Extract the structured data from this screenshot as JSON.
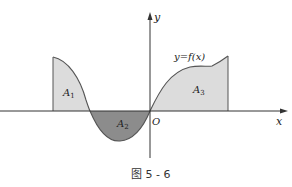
{
  "figure": {
    "caption": "图 5 - 6",
    "axes": {
      "x_label": "x",
      "y_label": "y",
      "origin_label": "O"
    },
    "curve_label": "y=f(x)",
    "regions": [
      {
        "id": "A1",
        "label": "A",
        "subscript": "1",
        "sign": "positive",
        "fill": "#dcdcdc"
      },
      {
        "id": "A2",
        "label": "A",
        "subscript": "2",
        "sign": "negative",
        "fill": "#8c8c8c"
      },
      {
        "id": "A3",
        "label": "A",
        "subscript": "3",
        "sign": "positive",
        "fill": "#dcdcdc"
      }
    ],
    "colors": {
      "curve": "#555555",
      "axis": "#333333",
      "light_fill": "#dcdcdc",
      "dark_fill": "#8c8c8c"
    }
  }
}
